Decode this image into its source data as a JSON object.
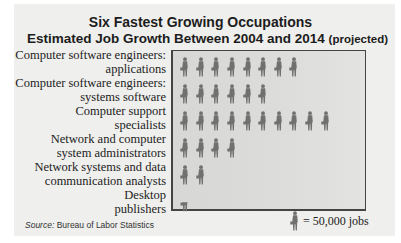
{
  "chart_data": {
    "type": "pictograph",
    "title": "Six Fastest Growing Occupations",
    "subtitle": "Estimated Job Growth Between 2004 and 2014",
    "subtitle_note": "(projected)",
    "icon": "worker-with-briefcase",
    "unit_value": 50000,
    "legend": "= 50,000 jobs",
    "categories": [
      "Computer software engineers: applications",
      "Computer software engineers: systems software",
      "Computer support specialists",
      "Network and computer system administrators",
      "Network systems and data communication analysts",
      "Desktop publishers"
    ],
    "icons": [
      8,
      6,
      10,
      4,
      2,
      0.5
    ],
    "values": [
      400000,
      300000,
      500000,
      200000,
      100000,
      25000
    ],
    "source": "Bureau of Labor Statistics"
  },
  "header": {
    "title": "Six Fastest Growing Occupations",
    "subtitle": "Estimated Job Growth Between 2004 and 2014",
    "subtitle_note": "(projected)"
  },
  "rows": [
    {
      "line1": "Computer software engineers:",
      "line2": "applications"
    },
    {
      "line1": "Computer software engineers:",
      "line2": "systems software"
    },
    {
      "line1": "Computer support",
      "line2": "specialists"
    },
    {
      "line1": "Network and computer",
      "line2": "system administrators"
    },
    {
      "line1": "Network systems and data",
      "line2": "communication analysts"
    },
    {
      "line1": "Desktop",
      "line2": "publishers"
    }
  ],
  "footer": {
    "source_label": "Source:",
    "source_text": " Bureau of Labor Statistics",
    "legend_text": "= 50,000 jobs"
  },
  "colors": {
    "icon": "#707070",
    "plot_bg": "#d9d9d7",
    "card_bg": "#efefed"
  }
}
